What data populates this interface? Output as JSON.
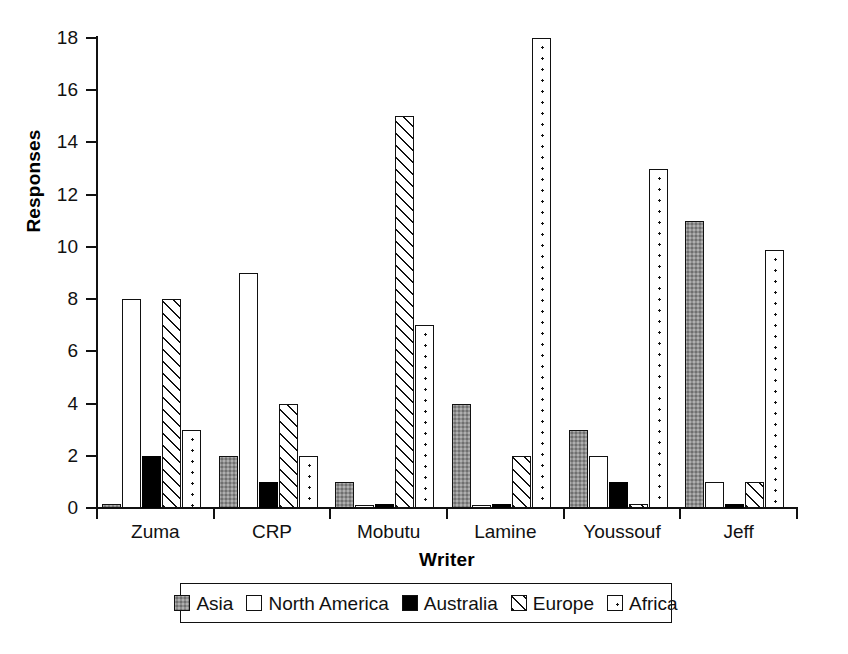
{
  "chart_data": {
    "type": "bar",
    "title": "",
    "xlabel": "Writer",
    "ylabel": "Responses",
    "categories": [
      "Zuma",
      "CRP",
      "Mobutu",
      "Lamine",
      "Youssouf",
      "Jeff"
    ],
    "series": [
      {
        "name": "Asia",
        "pattern": "solid-gray",
        "values": [
          0.15,
          2,
          1,
          4,
          3,
          11
        ]
      },
      {
        "name": "North America",
        "pattern": "white",
        "values": [
          8,
          9,
          0.12,
          0.12,
          2,
          1
        ]
      },
      {
        "name": "Australia",
        "pattern": "solid-black",
        "values": [
          2,
          1,
          0.15,
          0.15,
          1,
          0.15
        ]
      },
      {
        "name": "Europe",
        "pattern": "diagonal-hatch",
        "values": [
          8,
          4,
          15,
          2,
          0.15,
          1
        ]
      },
      {
        "name": "Africa",
        "pattern": "dotted",
        "values": [
          3,
          2,
          7,
          18,
          13,
          9.9
        ]
      }
    ],
    "ylim": [
      0,
      18
    ],
    "yticks": [
      0,
      2,
      4,
      6,
      8,
      10,
      12,
      14,
      16,
      18
    ],
    "ytick_labels": [
      "0",
      "2",
      "4",
      "6",
      "8",
      "10",
      "12",
      "14",
      "16",
      "18"
    ],
    "grid": false,
    "legend_position": "bottom-center",
    "legend_entries": [
      "Asia",
      "North America",
      "Australia",
      "Europe",
      "Africa"
    ],
    "colors": {
      "asia": "#8f8f8f",
      "north_america": "#ffffff",
      "australia": "#000000",
      "europe": "#ffffff",
      "africa": "#ffffff",
      "outline": "#111111",
      "background": "#ffffff"
    }
  }
}
